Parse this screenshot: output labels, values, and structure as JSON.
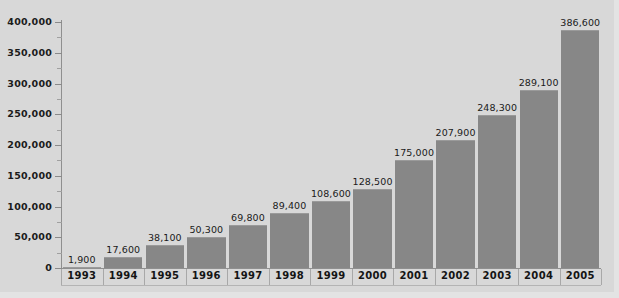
{
  "chart_data": {
    "type": "bar",
    "title": "",
    "xlabel": "",
    "ylabel": "",
    "categories": [
      "1993",
      "1994",
      "1995",
      "1996",
      "1997",
      "1998",
      "1999",
      "2000",
      "2001",
      "2002",
      "2003",
      "2004",
      "2005"
    ],
    "values": [
      1900,
      17600,
      38100,
      50300,
      69800,
      89400,
      108600,
      128500,
      175000,
      207900,
      248300,
      289100,
      386600
    ],
    "value_labels": [
      "1,900",
      "17,600",
      "38,100",
      "50,300",
      "69,800",
      "89,400",
      "108,600",
      "128,500",
      "175,000",
      "207,900",
      "248,300",
      "289,100",
      "386,600"
    ],
    "ylim": [
      0,
      400000
    ],
    "y_ticks": [
      0,
      50000,
      100000,
      150000,
      200000,
      250000,
      300000,
      350000,
      400000
    ],
    "y_tick_labels": [
      "0",
      "50,000",
      "100,000",
      "150,000",
      "200,000",
      "250,000",
      "300,000",
      "350,000",
      "400,000"
    ],
    "y_minor_tick_step": 25000,
    "grid": false,
    "legend": null,
    "legend_position": "none",
    "colors": {
      "background": "#d8d8d8",
      "bar_fill": "#878787",
      "axis": "#8f8f8f",
      "text": "#1a1a1a",
      "frame": "#e3e3e3"
    }
  }
}
